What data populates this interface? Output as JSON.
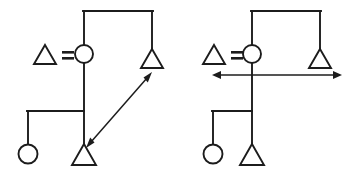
{
  "figure": {
    "width": 362,
    "height": 180,
    "background_color": "#ffffff",
    "ink_color": "#1c1c1c",
    "panel_count": 2
  },
  "legend": {
    "male_symbol": "triangle",
    "female_symbol": "circle",
    "relation_symbol": "=",
    "relation_meaning": "marriage / equals",
    "legend_text": "△ = ○"
  },
  "panels": [
    {
      "id": "left-panel",
      "name": "left-kinship-diagram",
      "arrow": {
        "name": "diagonal-double-arrow",
        "style": "double-headed",
        "orientation": "diagonal",
        "from_x": 86,
        "from_y": 148,
        "to_x": 152,
        "to_y": 72
      },
      "nodes": [
        {
          "name": "legend-male-triangle",
          "shape": "triangle",
          "cx": 45,
          "cy": 57
        },
        {
          "name": "ego-female-circle",
          "shape": "circle",
          "cx": 84,
          "cy": 54
        },
        {
          "name": "spouse-male-triangle",
          "shape": "triangle",
          "cx": 152,
          "cy": 58
        },
        {
          "name": "child-female-circle",
          "shape": "circle",
          "cx": 28,
          "cy": 153
        },
        {
          "name": "child-male-triangle",
          "shape": "triangle",
          "cx": 84,
          "cy": 152
        }
      ],
      "links": [
        {
          "name": "top-marriage-link",
          "type": "horizontal",
          "y": 11,
          "x1": 84,
          "x2": 152
        },
        {
          "name": "ego-riser",
          "type": "vertical",
          "x": 84,
          "y1": 11,
          "y2": 45
        },
        {
          "name": "spouse-riser",
          "type": "vertical",
          "x": 152,
          "y1": 11,
          "y2": 49
        },
        {
          "name": "descent-line",
          "type": "vertical",
          "x": 84,
          "y1": 63,
          "y2": 143
        },
        {
          "name": "sibling-bar",
          "type": "horizontal",
          "y": 111,
          "x1": 28,
          "x2": 84
        },
        {
          "name": "sibling-drop",
          "type": "vertical",
          "x": 28,
          "y1": 111,
          "y2": 144
        }
      ]
    },
    {
      "id": "right-panel",
      "name": "right-kinship-diagram",
      "arrow": {
        "name": "horizontal-double-arrow",
        "style": "double-headed",
        "orientation": "horizontal",
        "from_x": 212,
        "from_y": 75,
        "to_x": 342,
        "to_y": 75
      },
      "nodes": [
        {
          "name": "legend-male-triangle",
          "shape": "triangle",
          "cx": 214,
          "cy": 57
        },
        {
          "name": "ego-female-circle",
          "shape": "circle",
          "cx": 252,
          "cy": 54
        },
        {
          "name": "spouse-male-triangle",
          "shape": "triangle",
          "cx": 320,
          "cy": 58
        },
        {
          "name": "child-female-circle",
          "shape": "circle",
          "cx": 213,
          "cy": 153
        },
        {
          "name": "child-male-triangle",
          "shape": "triangle",
          "cx": 252,
          "cy": 152
        }
      ],
      "links": [
        {
          "name": "top-marriage-link",
          "type": "horizontal",
          "y": 11,
          "x1": 252,
          "x2": 320
        },
        {
          "name": "ego-riser",
          "type": "vertical",
          "x": 252,
          "y1": 11,
          "y2": 45
        },
        {
          "name": "spouse-riser",
          "type": "vertical",
          "x": 320,
          "y1": 11,
          "y2": 49
        },
        {
          "name": "descent-line",
          "type": "vertical",
          "x": 252,
          "y1": 63,
          "y2": 143
        },
        {
          "name": "sibling-bar",
          "type": "horizontal",
          "y": 111,
          "x1": 213,
          "x2": 252
        },
        {
          "name": "sibling-drop",
          "type": "vertical",
          "x": 213,
          "y1": 111,
          "y2": 144
        }
      ]
    }
  ]
}
